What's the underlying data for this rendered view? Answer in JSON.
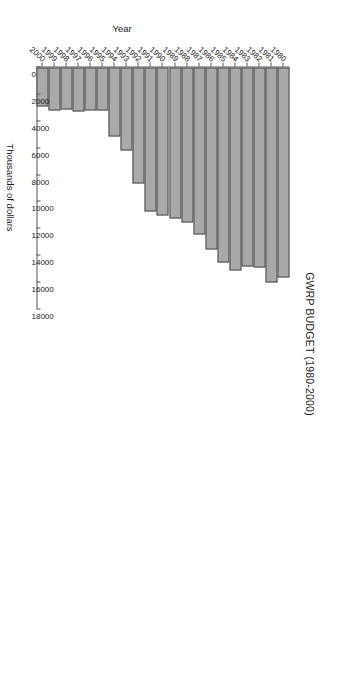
{
  "chart_data": {
    "type": "bar",
    "orientation": "vertical-rendered-rotated",
    "title": "GWRP BUDGET (1980-2000)",
    "xlabel": "Year",
    "ylabel": "Thousands of dollars",
    "categories": [
      "1980",
      "1981",
      "1982",
      "1983",
      "1984",
      "1985",
      "1986",
      "1987",
      "1988",
      "1989",
      "1990",
      "1991",
      "1992",
      "1993",
      "1994",
      "1995",
      "1996",
      "1997",
      "1998",
      "1999",
      "2000"
    ],
    "values": [
      15600,
      16000,
      14900,
      14800,
      15100,
      14500,
      13500,
      12400,
      11500,
      11200,
      11000,
      10700,
      8600,
      6200,
      5100,
      3200,
      3200,
      3300,
      3100,
      3200,
      2900
    ],
    "ylim": [
      0,
      18000
    ],
    "ytick_labels": [
      "18000",
      "16000",
      "14000",
      "12000",
      "10000",
      "8000",
      "6000",
      "4000",
      "2000",
      "0"
    ],
    "ytick_values": [
      18000,
      16000,
      14000,
      12000,
      10000,
      8000,
      6000,
      4000,
      2000,
      0
    ],
    "grid": false,
    "legend": false,
    "bar_color": "#a9a9a9",
    "bar_border_color": "#4a4a4a",
    "axis_color": "#555555",
    "text_color": "#1b1b1b",
    "background": "#ffffff"
  }
}
